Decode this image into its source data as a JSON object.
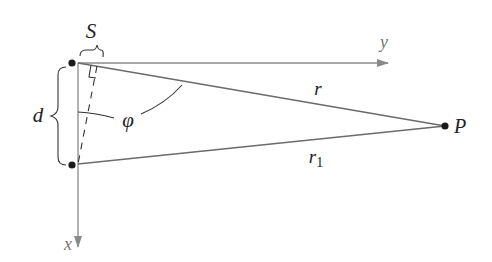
{
  "diagram": {
    "labels": {
      "path_difference": "S",
      "separation": "d",
      "angle": "φ",
      "distance_r": "r",
      "distance_r1_base": "r",
      "distance_r1_sub": "1",
      "point": "P",
      "x_axis": "x",
      "y_axis": "y"
    },
    "points": {
      "source_top": [
        72,
        63
      ],
      "source_bottom": [
        72,
        165
      ],
      "observer_P": [
        445,
        126
      ],
      "origin": [
        78,
        63
      ]
    },
    "colors": {
      "axis": "#8a8a8a",
      "line": "#6b6b6b",
      "ink": "#222222",
      "dot": "#1a1a1a"
    }
  }
}
